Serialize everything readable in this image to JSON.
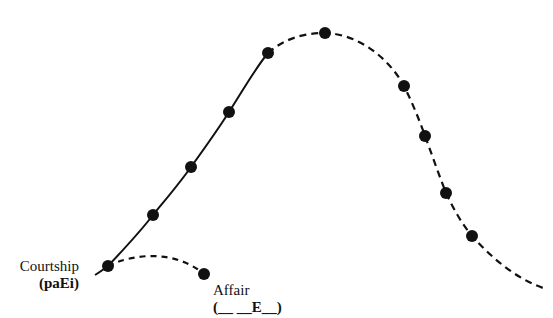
{
  "diagram": {
    "colors": {
      "background": "#ffffff",
      "ink": "#111111"
    },
    "labels": {
      "courtship": {
        "title": "Courtship",
        "code": "(paEi)"
      },
      "affair": {
        "title": "Affair",
        "code": "(__ __E__)"
      }
    },
    "curves": {
      "main_rising_solid": {
        "style": "solid",
        "points": [
          [
            95,
            275
          ],
          [
            108,
            266
          ],
          [
            153,
            215
          ],
          [
            191,
            167
          ],
          [
            229,
            112
          ],
          [
            268,
            53
          ]
        ]
      },
      "main_falling_dashed": {
        "style": "dashed",
        "points": [
          [
            268,
            53
          ],
          [
            325,
            33
          ],
          [
            404,
            86
          ],
          [
            425,
            136
          ],
          [
            446,
            193
          ],
          [
            472,
            236
          ],
          [
            543,
            288
          ]
        ]
      },
      "affair_branch_dashed": {
        "style": "dashed",
        "points": [
          [
            108,
            266
          ],
          [
            150,
            255
          ],
          [
            204,
            274
          ]
        ]
      }
    },
    "dots": [
      [
        108,
        266
      ],
      [
        153,
        215
      ],
      [
        191,
        167
      ],
      [
        229,
        112
      ],
      [
        268,
        53
      ],
      [
        325,
        33
      ],
      [
        404,
        86
      ],
      [
        425,
        136
      ],
      [
        446,
        193
      ],
      [
        472,
        236
      ],
      [
        204,
        274
      ]
    ]
  }
}
